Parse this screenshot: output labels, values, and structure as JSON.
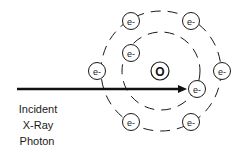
{
  "diagram": {
    "nucleus": {
      "label": "O",
      "cx": 160,
      "cy": 71,
      "r": 9
    },
    "inner_shell": {
      "cx": 161,
      "cy": 71,
      "r": 39
    },
    "outer_shell": {
      "cx": 161,
      "cy": 71,
      "r": 60
    },
    "electrons": [
      {
        "label": "e-",
        "shell": "outer",
        "cx": 131,
        "cy": 21
      },
      {
        "label": "e-",
        "shell": "outer",
        "cx": 191,
        "cy": 21
      },
      {
        "label": "e-",
        "shell": "outer",
        "cx": 97,
        "cy": 71
      },
      {
        "label": "e-",
        "shell": "outer",
        "cx": 222,
        "cy": 71
      },
      {
        "label": "e-",
        "shell": "outer",
        "cx": 131,
        "cy": 122
      },
      {
        "label": "e-",
        "shell": "outer",
        "cx": 191,
        "cy": 122
      },
      {
        "label": "e-",
        "shell": "inner",
        "cx": 131,
        "cy": 53
      },
      {
        "label": "e-",
        "shell": "inner",
        "cx": 197,
        "cy": 89
      }
    ],
    "photon_arrow": {
      "x1": 17,
      "y1": 89,
      "x2": 186,
      "y2": 89
    },
    "caption": [
      "Incident",
      "X-Ray",
      "Photon"
    ],
    "colors": {
      "stroke": "#1a1a1a",
      "background": "#ffffff"
    }
  }
}
